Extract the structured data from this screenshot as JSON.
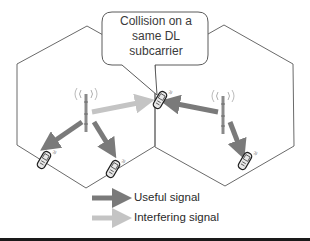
{
  "diagram": {
    "callout": {
      "lines": [
        "Collision on a",
        "same DL",
        "subcarrier"
      ]
    },
    "cells": [
      {
        "name": "left-cell",
        "base_station": "left-base-station",
        "users": [
          "user-left-1",
          "user-left-2"
        ]
      },
      {
        "name": "right-cell",
        "base_station": "right-base-station",
        "users": [
          "user-right-1"
        ]
      }
    ],
    "shared_user": "cell-edge-user",
    "legend": {
      "items": [
        {
          "label": "Useful signal",
          "color": "#7a7a7a"
        },
        {
          "label": "Interfering signal",
          "color": "#c4c4c4"
        }
      ]
    },
    "colors": {
      "cell_border": "#6a6a6a",
      "useful_arrow": "#7a7a7a",
      "interfering_arrow": "#c4c4c4",
      "callout_border": "#5a5a5a",
      "bottom_rule": "#1a1a1a"
    }
  }
}
